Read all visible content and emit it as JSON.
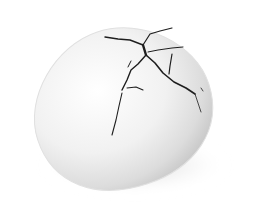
{
  "image": {
    "subject": "cracked white egg",
    "background_color": "#ffffff",
    "shell_color": "#f2f2f2",
    "shadow_color": "#cfcfcf",
    "crack_color": "#1e1e1e"
  }
}
